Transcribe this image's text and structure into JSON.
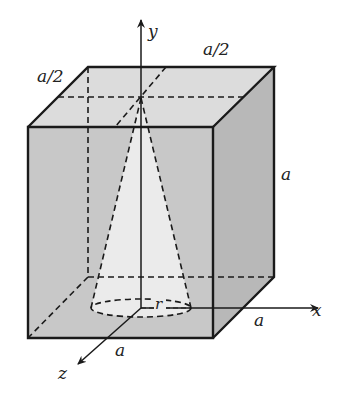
{
  "figure": {
    "type": "3d-geometry"
  },
  "labels": {
    "y_axis": "y",
    "x_axis": "x",
    "z_axis": "z",
    "top_left_half": "a/2",
    "top_right_half": "a/2",
    "height": "a",
    "x_side": "a",
    "z_side": "a",
    "radius": "r"
  },
  "colors": {
    "front_face": "#c9c9c9",
    "side_face": "#b9b9b9",
    "top_face": "#dedede",
    "cone": "#ececec",
    "edge": "#1a1a1a"
  }
}
